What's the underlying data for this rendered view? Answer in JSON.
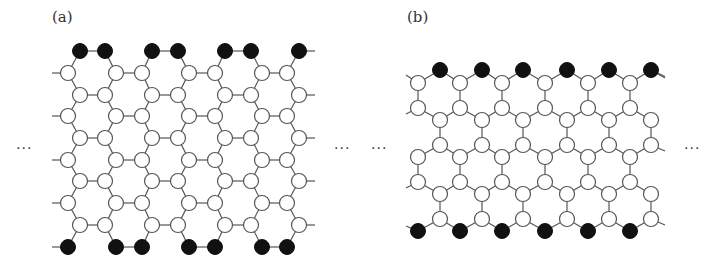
{
  "figure": {
    "panels": [
      {
        "id": "a",
        "label": "(a)",
        "label_pos": [
          52,
          8
        ],
        "type": "armchair",
        "description": "Armchair-edge honeycomb lattice with filled edge atoms on top and bottom rows",
        "row_ys": [
          51,
          73,
          95,
          116,
          138,
          160,
          181,
          203,
          225,
          247
        ],
        "row_types": [
          "A",
          "B",
          "A",
          "B",
          "A",
          "B",
          "A",
          "B",
          "A",
          "B"
        ],
        "A_xs": [
          80,
          105,
          152,
          178,
          225,
          251,
          299
        ],
        "B_xs": [
          68,
          116,
          142,
          189,
          215,
          262,
          287
        ],
        "A_pairs": [
          [
            0,
            1
          ],
          [
            2,
            3
          ],
          [
            4,
            5
          ]
        ],
        "B_pairs": [
          [
            1,
            2
          ],
          [
            3,
            4
          ],
          [
            5,
            6
          ]
        ],
        "left_stub_x": 52,
        "right_stub_x": 315,
        "filled_rows": [
          0,
          9
        ]
      },
      {
        "id": "b",
        "label": "(b)",
        "label_pos": [
          407,
          8
        ],
        "type": "zigzag",
        "description": "Zigzag-edge honeycomb lattice with filled edge atoms on top and bottom rows",
        "even_xs": [
          418,
          460,
          502,
          545,
          588,
          630
        ],
        "odd_xs": [
          440,
          482,
          523,
          567,
          609,
          651
        ],
        "rows": [
          {
            "y": 70,
            "parity": "odd",
            "filled": true
          },
          {
            "y": 83,
            "parity": "even",
            "filled": false
          },
          {
            "y": 108,
            "parity": "even",
            "filled": false
          },
          {
            "y": 120,
            "parity": "odd",
            "filled": false
          },
          {
            "y": 145,
            "parity": "odd",
            "filled": false
          },
          {
            "y": 157,
            "parity": "even",
            "filled": false
          },
          {
            "y": 182,
            "parity": "even",
            "filled": false
          },
          {
            "y": 194,
            "parity": "odd",
            "filled": false
          },
          {
            "y": 219,
            "parity": "odd",
            "filled": false
          },
          {
            "y": 231,
            "parity": "even",
            "filled": true
          }
        ],
        "left_stub_x": 406,
        "right_stub_x": 665
      }
    ],
    "ellipses": [
      {
        "text": "···",
        "x": 16,
        "y": 143
      },
      {
        "text": "···",
        "x": 334,
        "y": 143
      },
      {
        "text": "···",
        "x": 371,
        "y": 143
      },
      {
        "text": "···",
        "x": 684,
        "y": 143
      }
    ],
    "colors": {
      "bond": "#555555",
      "open_fill": "#ffffff",
      "filled": "#111111"
    },
    "node_radius": 7.5
  }
}
